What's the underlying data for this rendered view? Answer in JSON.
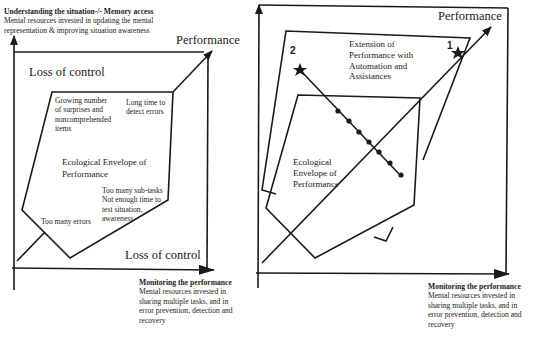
{
  "left_diagram": {
    "top_caption": {
      "title": "Understanding the situation-/- Memory access",
      "line1": "Mental resources invested in updating the mental",
      "line2": "representation & improving situation awareness"
    },
    "performance_label": "Performance",
    "loss_of_control_top": "Loss of control",
    "loss_of_control_bottom": "Loss of control",
    "envelope_label_1": "Ecological Envelope of",
    "envelope_label_2": "Performance",
    "annotations": {
      "surprises": [
        "Growing number",
        "of surprises and",
        "noncomprehended",
        "items"
      ],
      "long_time": [
        "Long time to",
        "detect errors"
      ],
      "sub_tasks": [
        "Too many sub-tasks",
        "Not enough time to",
        "test situation,",
        "awareness."
      ],
      "errors": "Too many errors"
    },
    "bottom_caption": {
      "title": "Monitoring the performance",
      "lines": [
        "Mental resources invested in",
        "sharing multiple tasks, and in",
        "error prevention, detection and",
        "recovery"
      ]
    }
  },
  "right_diagram": {
    "performance_label": "Performance",
    "extension_label": [
      "Extension of",
      "Performance with",
      "Automation and",
      "Assistances"
    ],
    "envelope_label": [
      "Ecological",
      "Envelope of",
      "Performance"
    ],
    "point_1": "1",
    "point_2": "2",
    "bottom_caption": {
      "title": "Monitoring the performance",
      "lines": [
        "Mental resources invested in",
        "sharing multiple tasks, and in",
        "error prevention, detection and",
        "recovery"
      ]
    }
  },
  "colors": {
    "ink": "#1a1a1a",
    "background": "#ffffff"
  }
}
